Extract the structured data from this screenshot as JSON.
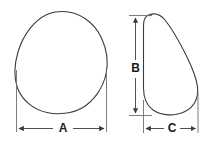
{
  "diagram": {
    "type": "engineering-dimension-drawing",
    "background_color": "#ffffff",
    "outline_color": "#3c3c3c",
    "dimension_line_color": "#3c3c3c",
    "extension_line_color": "#6e6e6e",
    "label_color": "#1a1a1a",
    "views": [
      {
        "name": "front-view",
        "shape": "egg-outline",
        "dimensions": [
          "A"
        ]
      },
      {
        "name": "side-view",
        "shape": "teardrop-profile-outline",
        "dimensions": [
          "B",
          "C"
        ]
      }
    ],
    "dimensions": [
      {
        "id": "A",
        "label": "A",
        "orientation": "horizontal",
        "view": "front-view",
        "meaning": "overall width"
      },
      {
        "id": "B",
        "label": "B",
        "orientation": "vertical",
        "view": "side-view",
        "meaning": "overall height"
      },
      {
        "id": "C",
        "label": "C",
        "orientation": "horizontal",
        "view": "side-view",
        "meaning": "overall depth"
      }
    ]
  }
}
